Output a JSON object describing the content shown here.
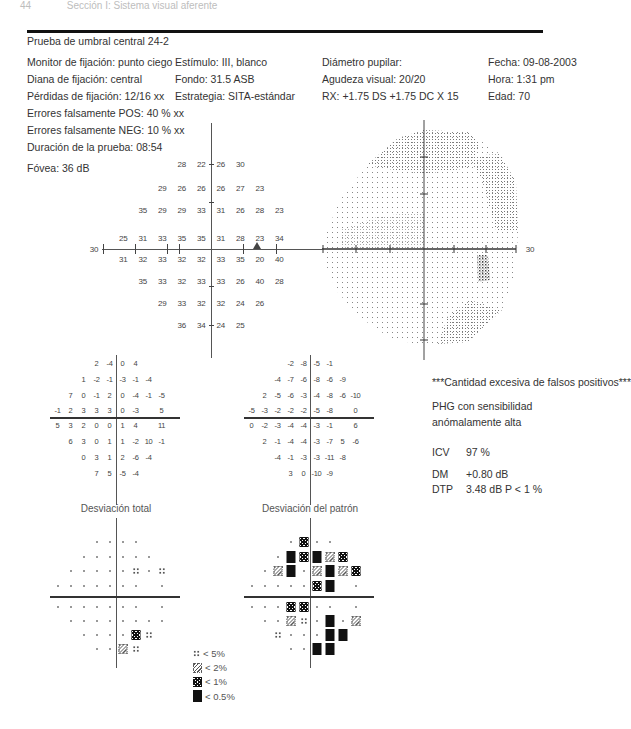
{
  "page_header": {
    "page_number": "44",
    "section": "Sección I: Sistema visual aferente"
  },
  "report": {
    "title": "Prueba de umbral central 24-2",
    "info_columns": [
      [
        "Monitor de fijación: punto ciego",
        "Diana de fijación: central",
        "Pérdidas de fijación: 12/16 xx",
        "Errores falsamente POS: 40 % xx",
        "Errores falsamente NEG: 10 % xx",
        "Duración de la prueba: 08:54"
      ],
      [
        "Estímulo: III, blanco",
        "Fondo: 31.5 ASB",
        "Estrategia: SITA-estándar"
      ],
      [
        "Diámetro pupilar:",
        "Agudeza visual: 20/20",
        "RX: +1.75 DS +1.75 DC X 15"
      ],
      [
        "Fecha: 09-08-2003",
        "Hora: 1:31 pm",
        "Edad: 70"
      ]
    ],
    "fovea": "Fóvea: 36 dB"
  },
  "threshold_plot": {
    "axis_label": "30",
    "rows": [
      [
        "",
        "",
        "",
        "28",
        "22",
        "26",
        "30",
        "",
        "",
        ""
      ],
      [
        "",
        "",
        "29",
        "26",
        "26",
        "26",
        "27",
        "23",
        "",
        ""
      ],
      [
        "",
        "35",
        "29",
        "29",
        "33",
        "31",
        "26",
        "28",
        "23",
        ""
      ],
      [
        "25",
        "31",
        "33",
        "35",
        "35",
        "31",
        "28",
        "23",
        "34",
        ""
      ],
      [
        "31",
        "32",
        "33",
        "32",
        "32",
        "33",
        "35",
        "20",
        "40",
        ""
      ],
      [
        "",
        "35",
        "33",
        "32",
        "33",
        "33",
        "26",
        "40",
        "28",
        ""
      ],
      [
        "",
        "",
        "29",
        "33",
        "32",
        "32",
        "24",
        "26",
        "",
        ""
      ],
      [
        "",
        "",
        "",
        "36",
        "34",
        "24",
        "25",
        "",
        "",
        ""
      ]
    ]
  },
  "grayscale_plot": {
    "axis_label": "30"
  },
  "total_deviation": {
    "label": "Desviación total",
    "rows": [
      [
        "",
        "",
        "",
        "2",
        "-4",
        "0",
        "4",
        "",
        "",
        ""
      ],
      [
        "",
        "",
        "1",
        "-2",
        "-1",
        "-3",
        "-1",
        "-4",
        "",
        ""
      ],
      [
        "",
        "7",
        "0",
        "-1",
        "2",
        "0",
        "-4",
        "-1",
        "-5",
        ""
      ],
      [
        "-1",
        "2",
        "3",
        "3",
        "3",
        "0",
        "-3",
        "",
        "5",
        ""
      ],
      [
        "5",
        "3",
        "2",
        "0",
        "0",
        "1",
        "4",
        "",
        "11",
        ""
      ],
      [
        "",
        "6",
        "3",
        "0",
        "1",
        "1",
        "-2",
        "10",
        "-1",
        ""
      ],
      [
        "",
        "",
        "0",
        "3",
        "1",
        "2",
        "-6",
        "-4",
        "",
        ""
      ],
      [
        "",
        "",
        "",
        "7",
        "5",
        "-5",
        "-4",
        "",
        "",
        ""
      ]
    ],
    "symbols": [
      [
        "",
        "",
        "",
        "d",
        "d",
        "d",
        "d",
        "",
        "",
        ""
      ],
      [
        "",
        "",
        "d",
        "d",
        "d",
        "d",
        "d",
        "d",
        "",
        ""
      ],
      [
        "",
        "d",
        "d",
        "d",
        "d",
        "d",
        "p5",
        "d",
        "p5",
        ""
      ],
      [
        "d",
        "d",
        "d",
        "d",
        "d",
        "d",
        "d",
        "",
        "d",
        ""
      ],
      [
        "d",
        "d",
        "d",
        "d",
        "d",
        "d",
        "d",
        "",
        "d",
        ""
      ],
      [
        "",
        "d",
        "d",
        "d",
        "d",
        "d",
        "d",
        "d",
        "d",
        ""
      ],
      [
        "",
        "",
        "d",
        "d",
        "d",
        "d",
        "p1",
        "p5",
        "",
        ""
      ],
      [
        "",
        "",
        "",
        "d",
        "d",
        "p2",
        "p5",
        "",
        "",
        ""
      ]
    ]
  },
  "pattern_deviation": {
    "label": "Desviación del patrón",
    "rows": [
      [
        "",
        "",
        "",
        "-2",
        "-8",
        "-5",
        "-1",
        "",
        "",
        ""
      ],
      [
        "",
        "",
        "-4",
        "-7",
        "-6",
        "-8",
        "-6",
        "-9",
        "",
        ""
      ],
      [
        "",
        "2",
        "-5",
        "-6",
        "-3",
        "-4",
        "-8",
        "-6",
        "-10",
        ""
      ],
      [
        "-5",
        "-3",
        "-2",
        "-2",
        "-2",
        "-5",
        "-8",
        "",
        "0",
        ""
      ],
      [
        "0",
        "-2",
        "-3",
        "-4",
        "-4",
        "-3",
        "-1",
        "",
        "6",
        ""
      ],
      [
        "",
        "2",
        "-1",
        "-4",
        "-4",
        "-3",
        "-7",
        "5",
        "-6",
        ""
      ],
      [
        "",
        "",
        "-4",
        "-1",
        "-3",
        "-3",
        "-11",
        "-8",
        "",
        ""
      ],
      [
        "",
        "",
        "",
        "3",
        "0",
        "-10",
        "-9",
        "",
        "",
        ""
      ]
    ],
    "symbols": [
      [
        "",
        "",
        "",
        "d",
        "p1",
        "d",
        "d",
        "",
        "",
        ""
      ],
      [
        "",
        "",
        "d",
        "p05",
        "p1",
        "p05",
        "p2",
        "p1",
        "",
        ""
      ],
      [
        "",
        "d",
        "p2",
        "p05",
        "d",
        "p2",
        "p05",
        "p2",
        "p1",
        ""
      ],
      [
        "d",
        "d",
        "d",
        "d",
        "d",
        "p1",
        "p05",
        "",
        "d",
        ""
      ],
      [
        "d",
        "d",
        "d",
        "p1",
        "p1",
        "d",
        "d",
        "",
        "d",
        ""
      ],
      [
        "",
        "d",
        "d",
        "p2",
        "p5",
        "d",
        "p05",
        "d",
        "p2",
        ""
      ],
      [
        "",
        "",
        "p5",
        "d",
        "d",
        "d",
        "p05",
        "p05",
        "",
        ""
      ],
      [
        "",
        "",
        "",
        "d",
        "d",
        "p05",
        "p05",
        "",
        "",
        ""
      ]
    ]
  },
  "summary": {
    "warning": "***Cantidad excesiva de falsos positivos***",
    "phg_line1": "PHG con sensibilidad",
    "phg_line2": "anómalamente alta",
    "icv_label": "ICV",
    "icv_value": "97 %",
    "dm_label": "DM",
    "dm_value": "+0.80 dB",
    "dtp_label": "DTP",
    "dtp_value": "3.48 dB P < 1 %"
  },
  "legend": [
    {
      "symbol": "p5",
      "label": "< 5%"
    },
    {
      "symbol": "p2",
      "label": "< 2%"
    },
    {
      "symbol": "p1",
      "label": "< 1%"
    },
    {
      "symbol": "p05",
      "label": "< 0.5%"
    }
  ]
}
